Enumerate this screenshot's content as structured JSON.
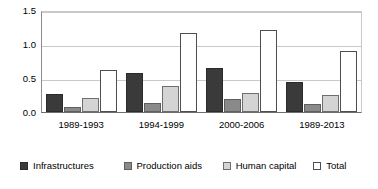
{
  "chart_data": {
    "type": "bar",
    "title": "",
    "xlabel": "",
    "ylabel": "",
    "categories": [
      "1989-1993",
      "1994-1999",
      "2000-2006",
      "1989-2013"
    ],
    "series": [
      {
        "name": "Infrastructures",
        "color": "#3a3a3a",
        "values": [
          0.27,
          0.58,
          0.66,
          0.45
        ]
      },
      {
        "name": "Production aids",
        "color": "#8a8a8a",
        "values": [
          0.07,
          0.13,
          0.2,
          0.12
        ]
      },
      {
        "name": "Human capital",
        "color": "#d4d4d4",
        "values": [
          0.21,
          0.38,
          0.28,
          0.25
        ]
      },
      {
        "name": "Total",
        "color": "#ffffff",
        "values": [
          0.63,
          1.17,
          1.22,
          0.9
        ]
      }
    ],
    "ylim": [
      0.0,
      1.5
    ],
    "yticks": [
      0.0,
      0.5,
      1.0,
      1.5
    ],
    "ytick_labels": [
      "0.0",
      "0.5",
      "1.0",
      "1.5"
    ],
    "grid": true,
    "legend_position": "bottom"
  },
  "axis": {
    "y_labels": [
      "1.5",
      "1.0",
      "0.5",
      "0.0"
    ]
  },
  "legend": {
    "items": [
      {
        "label": "Infrastructures"
      },
      {
        "label": "Production aids"
      },
      {
        "label": "Human capital"
      },
      {
        "label": "Total"
      }
    ]
  }
}
